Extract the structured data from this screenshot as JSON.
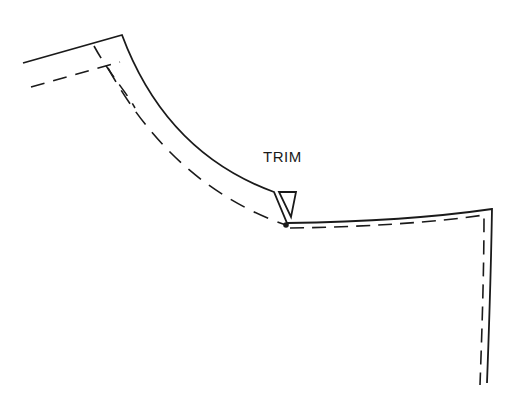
{
  "diagram": {
    "type": "pattern-piece-seam-allowance",
    "labels": {
      "trim": "TRIM"
    },
    "elements": [
      {
        "name": "cutting-line",
        "style": "solid"
      },
      {
        "name": "seam-line",
        "style": "dashed"
      },
      {
        "name": "trim-wedge",
        "style": "solid-outline"
      },
      {
        "name": "pivot-point",
        "style": "filled-dot"
      }
    ],
    "colors": {
      "stroke": "#1a1a1a",
      "background": "#ffffff"
    }
  }
}
